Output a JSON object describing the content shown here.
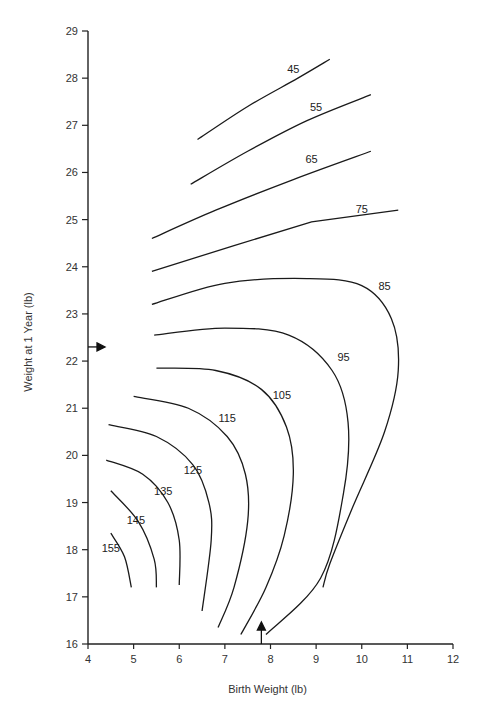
{
  "chart_data": {
    "type": "contour",
    "title": "",
    "xlabel": "Birth Weight (lb)",
    "ylabel": "Weight at 1 Year (lb)",
    "xlim": [
      4,
      12
    ],
    "ylim": [
      16,
      29
    ],
    "x_ticks": [
      4,
      5,
      6,
      7,
      8,
      9,
      10,
      11,
      12
    ],
    "y_ticks": [
      16,
      17,
      18,
      19,
      20,
      21,
      22,
      23,
      24,
      25,
      26,
      27,
      28,
      29
    ],
    "grid": false,
    "legend": null,
    "markers": [
      {
        "type": "arrow-right",
        "axis": "y",
        "value": 22.3
      },
      {
        "type": "arrow-up",
        "axis": "x",
        "value": 7.8
      }
    ],
    "contours": [
      {
        "level": 45,
        "label": "45",
        "label_at": [
          8.5,
          28.1
        ],
        "points": [
          [
            6.4,
            26.7
          ],
          [
            7.5,
            27.4
          ],
          [
            8.6,
            28.0
          ],
          [
            9.3,
            28.4
          ]
        ]
      },
      {
        "level": 55,
        "label": "55",
        "label_at": [
          9.0,
          27.3
        ],
        "points": [
          [
            6.25,
            25.75
          ],
          [
            7.5,
            26.45
          ],
          [
            8.8,
            27.1
          ],
          [
            10.2,
            27.65
          ]
        ]
      },
      {
        "level": 65,
        "label": "65",
        "label_at": [
          8.9,
          26.2
        ],
        "points": [
          [
            5.4,
            24.6
          ],
          [
            6.8,
            25.2
          ],
          [
            8.5,
            25.85
          ],
          [
            10.2,
            26.45
          ]
        ]
      },
      {
        "level": 75,
        "label": "75",
        "label_at": [
          10.0,
          25.15
        ],
        "points": [
          [
            5.4,
            23.9
          ],
          [
            7.2,
            24.45
          ],
          [
            8.9,
            24.95
          ],
          [
            10.8,
            25.2
          ]
        ]
      },
      {
        "level": 85,
        "label": "85",
        "label_at": [
          10.5,
          23.5
        ],
        "points": [
          [
            5.4,
            23.2
          ],
          [
            7.0,
            23.65
          ],
          [
            8.8,
            23.75
          ],
          [
            10.0,
            23.6
          ],
          [
            10.65,
            22.9
          ],
          [
            10.8,
            21.8
          ],
          [
            10.5,
            20.5
          ],
          [
            9.8,
            18.9
          ],
          [
            9.3,
            17.7
          ],
          [
            9.15,
            17.2
          ]
        ]
      },
      {
        "level": 95,
        "label": "95",
        "label_at": [
          9.6,
          22.0
        ],
        "points": [
          [
            5.45,
            22.55
          ],
          [
            7.0,
            22.7
          ],
          [
            8.4,
            22.55
          ],
          [
            9.35,
            21.8
          ],
          [
            9.7,
            20.7
          ],
          [
            9.6,
            19.2
          ],
          [
            9.1,
            17.4
          ],
          [
            7.9,
            16.2
          ]
        ]
      },
      {
        "level": 105,
        "label": "105",
        "label_at": [
          8.25,
          21.2
        ],
        "points": [
          [
            5.5,
            21.85
          ],
          [
            6.8,
            21.8
          ],
          [
            7.8,
            21.4
          ],
          [
            8.35,
            20.6
          ],
          [
            8.5,
            19.6
          ],
          [
            8.3,
            18.3
          ],
          [
            7.9,
            17.2
          ],
          [
            7.35,
            16.2
          ]
        ]
      },
      {
        "level": 115,
        "label": "115",
        "label_at": [
          7.05,
          20.7
        ],
        "points": [
          [
            5.0,
            21.25
          ],
          [
            6.2,
            21.0
          ],
          [
            7.05,
            20.4
          ],
          [
            7.45,
            19.6
          ],
          [
            7.5,
            18.6
          ],
          [
            7.2,
            17.2
          ],
          [
            6.85,
            16.35
          ]
        ]
      },
      {
        "level": 125,
        "label": "125",
        "label_at": [
          6.3,
          19.6
        ],
        "points": [
          [
            4.45,
            20.65
          ],
          [
            5.5,
            20.4
          ],
          [
            6.3,
            19.8
          ],
          [
            6.65,
            19.0
          ],
          [
            6.7,
            18.2
          ],
          [
            6.5,
            16.7
          ]
        ]
      },
      {
        "level": 135,
        "label": "135",
        "label_at": [
          5.65,
          19.15
        ],
        "points": [
          [
            4.4,
            19.9
          ],
          [
            5.2,
            19.6
          ],
          [
            5.75,
            19.0
          ],
          [
            6.0,
            18.2
          ],
          [
            6.0,
            17.25
          ]
        ]
      },
      {
        "level": 145,
        "label": "145",
        "label_at": [
          5.05,
          18.55
        ],
        "points": [
          [
            4.5,
            19.25
          ],
          [
            5.1,
            18.6
          ],
          [
            5.45,
            17.8
          ],
          [
            5.5,
            17.2
          ]
        ]
      },
      {
        "level": 155,
        "label": "155",
        "label_at": [
          4.5,
          17.95
        ],
        "points": [
          [
            4.5,
            18.35
          ],
          [
            4.8,
            17.85
          ],
          [
            4.95,
            17.2
          ]
        ]
      }
    ]
  },
  "plot_area": {
    "x0_px": 88,
    "x1_px": 453,
    "y0_px": 644,
    "y1_px": 31
  }
}
